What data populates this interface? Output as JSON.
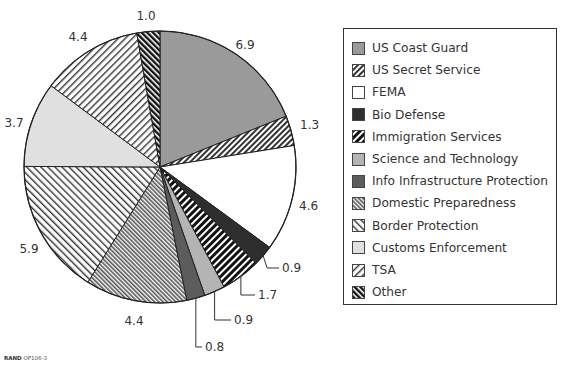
{
  "chart_data": {
    "type": "pie",
    "title": "",
    "categories": [
      "US Coast Guard",
      "US Secret Service",
      "FEMA",
      "Bio Defense",
      "Immigration Services",
      "Science and Technology",
      "Info Infrastructure Protection",
      "Domestic Preparedness",
      "Border Protection",
      "Customs Enforcement",
      "TSA",
      "Other"
    ],
    "values": [
      6.9,
      1.3,
      4.6,
      0.9,
      1.7,
      0.9,
      0.8,
      4.4,
      5.9,
      3.7,
      4.4,
      1.0
    ],
    "value_labels": [
      "6.9",
      "1.3",
      "4.6",
      "0.9",
      "1.7",
      "0.9",
      "0.8",
      "4.4",
      "5.9",
      "3.7",
      "4.4",
      "1.0"
    ],
    "start_angle": "12 o'clock",
    "direction": "clockwise",
    "legend_position": "right"
  },
  "legend": {
    "items": [
      {
        "label": "US Coast Guard",
        "fill": "solid",
        "color": "#9a9a9a"
      },
      {
        "label": "US Secret Service",
        "fill": "dense-diagonal-right",
        "color": "#333333"
      },
      {
        "label": "FEMA",
        "fill": "solid",
        "color": "#ffffff"
      },
      {
        "label": "Bio Defense",
        "fill": "solid",
        "color": "#2e2e2e"
      },
      {
        "label": "Immigration Services",
        "fill": "bold-diagonal-right",
        "color": "#111111"
      },
      {
        "label": "Science and Technology",
        "fill": "solid",
        "color": "#b4b4b4"
      },
      {
        "label": "Info Infrastructure Protection",
        "fill": "solid",
        "color": "#5c5c5c"
      },
      {
        "label": "Domestic Preparedness",
        "fill": "dense-diagonal-left",
        "color": "#555555"
      },
      {
        "label": "Border Protection",
        "fill": "wide-diagonal-left",
        "color": "#333333"
      },
      {
        "label": "Customs Enforcement",
        "fill": "solid",
        "color": "#e0e0e0"
      },
      {
        "label": "TSA",
        "fill": "wide-diagonal-right",
        "color": "#333333"
      },
      {
        "label": "Other",
        "fill": "bold-diagonal-left",
        "color": "#111111"
      }
    ]
  },
  "credit": {
    "org": "RAND",
    "code": "OP106-3"
  }
}
